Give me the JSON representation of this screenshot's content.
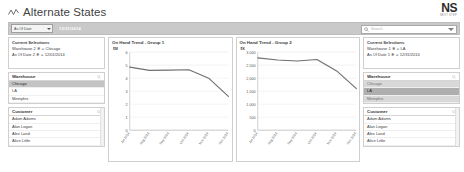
{
  "header": {
    "title": "Alternate States",
    "icon": "zigzag-chart-icon",
    "logo_mark": "NS",
    "logo_sub": "NEXT STEP"
  },
  "toolbar": {
    "select_label": "As Of Date",
    "date_value": "12/31/2014",
    "search_placeholder": "Search"
  },
  "left": {
    "selections": {
      "title": "Current Selections",
      "rows": [
        {
          "field": "Warehouse 2",
          "lock": "✱",
          "op": "=",
          "value": "Chicago"
        },
        {
          "field": "As Of Date 2",
          "lock": "✱",
          "op": "=",
          "value": "12/01/2014"
        }
      ]
    },
    "warehouse": {
      "title": "Warehouse",
      "items": [
        {
          "label": "Chicago",
          "state": "selected"
        },
        {
          "label": "LA",
          "state": "normal"
        },
        {
          "label": "Memphis",
          "state": "normal"
        }
      ]
    },
    "customer": {
      "title": "Customer",
      "items": [
        {
          "label": "Adam Adams",
          "state": "normal"
        },
        {
          "label": "Alan Logan",
          "state": "normal"
        },
        {
          "label": "Alex Land",
          "state": "normal"
        },
        {
          "label": "Alice Little",
          "state": "normal"
        }
      ]
    }
  },
  "right": {
    "selections": {
      "title": "Current Selections",
      "rows": [
        {
          "field": "Warehouse 1",
          "lock": "✱",
          "op": "=",
          "value": "LA"
        },
        {
          "field": "As Of Date 1",
          "lock": "✱",
          "op": "=",
          "value": "12/31/2014"
        }
      ]
    },
    "warehouse": {
      "title": "Warehouse",
      "items": [
        {
          "label": "Chicago",
          "state": "excluded"
        },
        {
          "label": "LA",
          "state": "selected"
        },
        {
          "label": "Memphis",
          "state": "excluded"
        }
      ]
    },
    "customer": {
      "title": "Customer",
      "items": [
        {
          "label": "Adam Adams",
          "state": "normal"
        },
        {
          "label": "Alan Logan",
          "state": "normal"
        },
        {
          "label": "Alex Land",
          "state": "normal"
        },
        {
          "label": "Alice Little",
          "state": "normal"
        }
      ]
    }
  },
  "chart_data": [
    {
      "id": "group1",
      "type": "line",
      "title": "On Hand Trend - Group 1",
      "xlabel": "",
      "ylabel": "$M",
      "ylim": [
        0,
        6
      ],
      "yticks": [
        0,
        1,
        2,
        3,
        4,
        5,
        6
      ],
      "ytick_labels": [
        "0",
        "1",
        "2",
        "3",
        "4",
        "5",
        "6"
      ],
      "grid": true,
      "legend": "none",
      "categories": [
        "Jul 2014",
        "Aug 2014",
        "Sep 2014",
        "Oct 2014",
        "Nov 2014",
        "Dec 2014"
      ],
      "values": [
        4.85,
        4.6,
        4.62,
        4.65,
        4.0,
        2.6
      ],
      "line_color": "#6f6f6f"
    },
    {
      "id": "group2",
      "type": "line",
      "title": "On Hand Trend - Group 2",
      "xlabel": "",
      "ylabel": "$K",
      "ylim": [
        0,
        3000
      ],
      "yticks": [
        0,
        500,
        1000,
        1500,
        2000,
        2500,
        3000
      ],
      "ytick_labels": [
        "0",
        "500",
        "1,000",
        "1,500",
        "2,000",
        "2,500",
        "3,000"
      ],
      "grid": true,
      "legend": "none",
      "categories": [
        "Jul 2014",
        "Aug 2014",
        "Sep 2014",
        "Oct 2014",
        "Nov 2014",
        "Dec 2014"
      ],
      "values": [
        2780,
        2700,
        2660,
        2720,
        2280,
        1600
      ],
      "line_color": "#6f6f6f"
    }
  ]
}
